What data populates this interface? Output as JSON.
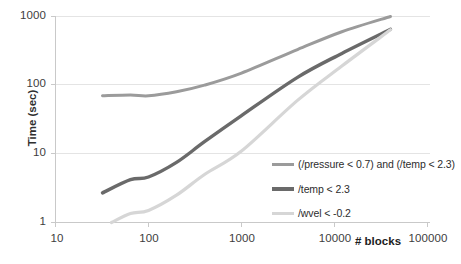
{
  "chart_data": {
    "type": "line",
    "title": "",
    "xlabel": "# blocks",
    "ylabel": "Time (sec)",
    "xscale": "log",
    "yscale": "log",
    "xlim": [
      10,
      100000
    ],
    "ylim": [
      1,
      1000
    ],
    "grid": true,
    "legend_position": "inside-right",
    "xticks": [
      "10",
      "100",
      "1000",
      "10000",
      "100000"
    ],
    "xtick_values": [
      10,
      100,
      1000,
      10000,
      100000
    ],
    "yticks": [
      "1",
      "10",
      "100",
      "1000"
    ],
    "ytick_values": [
      1,
      10,
      100,
      1000
    ],
    "series": [
      {
        "name": "(/pressure < 0.7) and (/temp < 2.3)",
        "color": "#9b9b9b",
        "width": 3.0,
        "x": [
          32,
          64,
          100,
          200,
          400,
          1000,
          4000,
          12000,
          40000
        ],
        "y": [
          70,
          72,
          70,
          80,
          100,
          150,
          330,
          600,
          1000
        ]
      },
      {
        "name": "/temp < 2.3",
        "color": "#6a6a6a",
        "width": 3.4,
        "x": [
          32,
          64,
          100,
          200,
          400,
          1000,
          4000,
          12000,
          40000
        ],
        "y": [
          2.7,
          4.2,
          4.6,
          7.5,
          15,
          36,
          130,
          290,
          650
        ]
      },
      {
        "name": "/wvel < -0.2",
        "color": "#d6d6d6",
        "width": 3.2,
        "x": [
          40,
          64,
          100,
          200,
          400,
          1000,
          4000,
          12000,
          40000
        ],
        "y": [
          1.0,
          1.35,
          1.5,
          2.5,
          5.0,
          11,
          60,
          190,
          640
        ]
      }
    ]
  },
  "axes": {
    "y_title": "Time (sec)",
    "x_title": "# blocks",
    "y_labels": [
      "1000",
      "100",
      "10",
      "1"
    ],
    "x_labels": [
      "10",
      "100",
      "1000",
      "10000",
      "100000"
    ]
  },
  "legend": {
    "items": [
      {
        "label": "(/pressure < 0.7) and (/temp < 2.3)",
        "color": "#9b9b9b"
      },
      {
        "label": "/temp < 2.3",
        "color": "#6a6a6a"
      },
      {
        "label": "/wvel < -0.2",
        "color": "#d6d6d6"
      }
    ]
  },
  "colors": {
    "grid": "#e2e2e2",
    "axis": "#c9c9c9",
    "text": "#3a3a3a",
    "background": "#ffffff"
  }
}
